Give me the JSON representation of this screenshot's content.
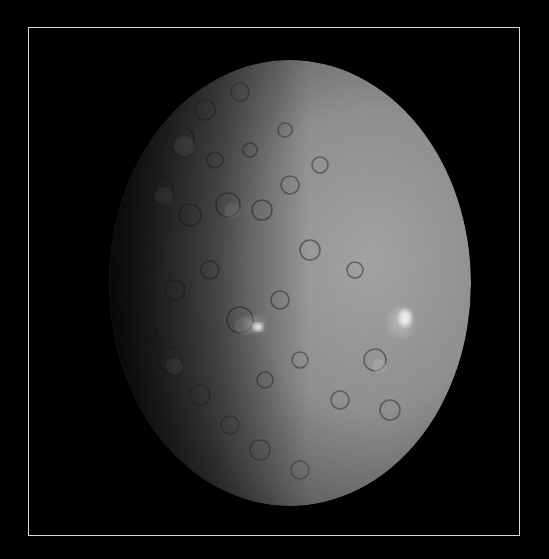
{
  "image": {
    "subject": "dwarf planet Ceres",
    "description": "Grayscale photograph of a heavily cratered spherical body, illuminated from the right, with two bright white spots; dark space background inside a thin white border frame",
    "colors": {
      "background": "#000000",
      "frame": "#d8d8d8",
      "surface_lit": "#9a9a9a",
      "surface_mid": "#6e6e6e",
      "surface_dark": "#2a2a2a",
      "bright_spot": "#f4f4f4"
    },
    "features": [
      {
        "name": "bright-spot-primary",
        "x": 405,
        "y": 318
      },
      {
        "name": "bright-spot-secondary",
        "x": 258,
        "y": 327
      }
    ]
  }
}
